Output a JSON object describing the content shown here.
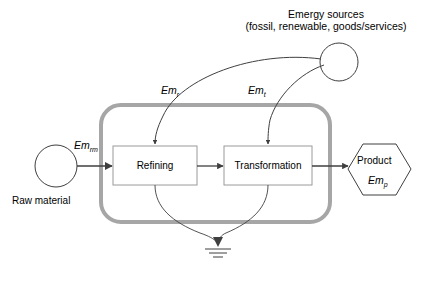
{
  "diagram": {
    "type": "emergy-systems-diagram",
    "colors": {
      "boundary": "#a6a6a6",
      "line": "#3f3f3f",
      "box_stroke": "#9a9a9a",
      "text": "#000000",
      "background": "#ffffff"
    },
    "source": {
      "title_line1": "Emergy sources",
      "title_line2": "(fossil, renewable, goods/services)",
      "symbol_name": "source-circle"
    },
    "raw_material": {
      "label": "Raw material",
      "flow_label_prefix": "Em",
      "flow_label_sub": "rm",
      "symbol_name": "source-circle"
    },
    "processes": [
      {
        "id": "refining",
        "label": "Refining"
      },
      {
        "id": "transformation",
        "label": "Transformation"
      }
    ],
    "flows": [
      {
        "id": "em-r",
        "prefix": "Em",
        "sub": "r",
        "from": "emergy-sources",
        "to": "refining"
      },
      {
        "id": "em-t",
        "prefix": "Em",
        "sub": "t",
        "from": "emergy-sources",
        "to": "transformation"
      }
    ],
    "product": {
      "label": "Product",
      "flow_label_prefix": "Em",
      "flow_label_sub": "p",
      "symbol_name": "product-hexagon"
    },
    "waste": {
      "symbol_name": "ground-heat-sink"
    }
  }
}
